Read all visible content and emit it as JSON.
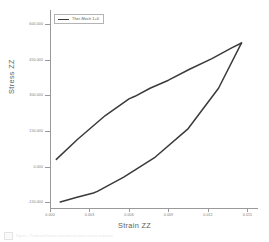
{
  "chart_data": {
    "type": "line",
    "title": "",
    "xlabel": "Strain ZZ",
    "ylabel": "Stress ZZ",
    "xlim": [
      0.0,
      0.0158
    ],
    "ylim": [
      -175.0,
      660.0
    ],
    "xticks": [
      "0.000",
      "0.003",
      "0.006",
      "0.009",
      "0.012",
      "0.015"
    ],
    "xtick_values": [
      0.0,
      0.003,
      0.006,
      0.009,
      0.012,
      0.015
    ],
    "yticks": [
      "600.000",
      "450.000",
      "300.000",
      "150.000",
      "0.000",
      "-150.000"
    ],
    "ytick_values": [
      600.0,
      450.0,
      300.0,
      150.0,
      0.0,
      -150.0
    ],
    "grid": false,
    "legend_position": "upper left",
    "legend": [
      "Ther-Mech 1+0"
    ],
    "series": [
      {
        "name": "Ther-Mech 1+0",
        "color": "#3a3a3a",
        "branch": "loading",
        "x": [
          0.00048,
          0.0021,
          0.0042,
          0.006,
          0.00645,
          0.0076,
          0.009,
          0.0106,
          0.0123,
          0.0138,
          0.01455
        ],
        "y": [
          30.0,
          115.0,
          215.0,
          285.0,
          296.0,
          330.0,
          364.0,
          410.0,
          455.0,
          500.0,
          521.0
        ]
      },
      {
        "name": "Ther-Mech 1+0",
        "color": "#3a3a3a",
        "branch": "unloading",
        "x": [
          0.00078,
          0.00205,
          0.0033,
          0.0036,
          0.0056,
          0.008,
          0.0105,
          0.0128,
          0.01455
        ],
        "y": [
          -150.0,
          -130.0,
          -112.0,
          -105.0,
          -45.0,
          40.0,
          160.0,
          330.0,
          521.0
        ]
      }
    ]
  },
  "legend": {
    "entry_label": "Ther-Mech 1+0",
    "swatch_name": "line-swatch"
  },
  "caption": {
    "text": "Figure  -  Predicted thermo-mechanical stress-strain response"
  }
}
